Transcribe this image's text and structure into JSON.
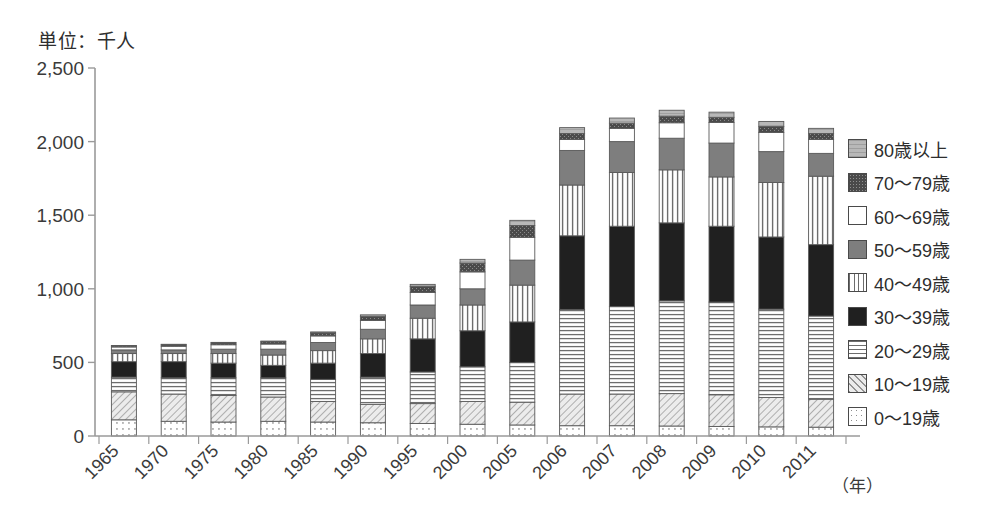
{
  "title_unit": "単位：千人",
  "axis": {
    "x_unit_label": "（年）",
    "y_ticks": [
      "0",
      "500",
      "1,000",
      "1,500",
      "2,000",
      "2,500"
    ]
  },
  "legend": {
    "items": [
      {
        "label": "80歳以上",
        "pattern": "light-gray-hlines",
        "color": "#b9b9b9"
      },
      {
        "label": "70〜79歳",
        "pattern": "dark-speckle",
        "color": "#555555"
      },
      {
        "label": "60〜69歳",
        "pattern": "white",
        "color": "#ffffff"
      },
      {
        "label": "50〜59歳",
        "pattern": "mid-gray",
        "color": "#7c7c7c"
      },
      {
        "label": "40〜49歳",
        "pattern": "vertical-lines",
        "color": "#ffffff"
      },
      {
        "label": "30〜39歳",
        "pattern": "black",
        "color": "#1c1c1c"
      },
      {
        "label": "20〜29歳",
        "pattern": "horizontal-lines",
        "color": "#ffffff"
      },
      {
        "label": "10〜19歳",
        "pattern": "diagonal-hatch",
        "color": "#e2e2e2"
      },
      {
        "label": "0〜19歳",
        "pattern": "dotted-grid",
        "color": "#ffffff"
      }
    ]
  },
  "chart_data": {
    "type": "bar",
    "subtype": "stacked",
    "title": "単位：千人",
    "xlabel": "（年）",
    "ylabel": "千人",
    "ylim": [
      0,
      2500
    ],
    "grid": false,
    "legend_position": "right",
    "categories": [
      "1965",
      "1970",
      "1975",
      "1980",
      "1985",
      "1990",
      "1995",
      "2000",
      "2005",
      "2006",
      "2007",
      "2008",
      "2009",
      "2010",
      "2011"
    ],
    "series": [
      {
        "name": "0〜19歳",
        "values": [
          110,
          100,
          95,
          100,
          95,
          90,
          85,
          80,
          75,
          70,
          70,
          68,
          65,
          62,
          60
        ]
      },
      {
        "name": "10〜19歳",
        "values": [
          190,
          185,
          180,
          165,
          140,
          125,
          135,
          155,
          155,
          215,
          215,
          220,
          215,
          200,
          190
        ]
      },
      {
        "name": "20〜29歳",
        "values": [
          100,
          110,
          120,
          130,
          150,
          185,
          215,
          235,
          270,
          575,
          595,
          630,
          630,
          600,
          565
        ]
      },
      {
        "name": "30〜39歳",
        "values": [
          105,
          110,
          100,
          85,
          110,
          160,
          225,
          245,
          275,
          500,
          545,
          530,
          515,
          490,
          485
        ]
      },
      {
        "name": "40〜49歳",
        "values": [
          55,
          55,
          65,
          70,
          85,
          100,
          140,
          175,
          250,
          345,
          365,
          360,
          335,
          370,
          465
        ]
      },
      {
        "name": "50〜59歳",
        "values": [
          25,
          25,
          30,
          40,
          55,
          65,
          90,
          110,
          170,
          235,
          210,
          215,
          230,
          210,
          155
        ]
      },
      {
        "name": "60〜69歳",
        "values": [
          20,
          25,
          30,
          35,
          45,
          60,
          85,
          115,
          155,
          75,
          90,
          105,
          140,
          130,
          95
        ]
      },
      {
        "name": "70〜79歳",
        "values": [
          8,
          10,
          12,
          15,
          20,
          28,
          40,
          60,
          80,
          40,
          35,
          45,
          35,
          40,
          40
        ]
      },
      {
        "name": "80歳以上",
        "values": [
          2,
          3,
          4,
          5,
          7,
          10,
          15,
          25,
          35,
          40,
          35,
          40,
          35,
          35,
          35
        ]
      }
    ],
    "totals": [
      615,
      623,
      636,
      645,
      707,
      823,
      1030,
      1200,
      1465,
      2095,
      2160,
      2213,
      2200,
      2137,
      2090
    ]
  }
}
